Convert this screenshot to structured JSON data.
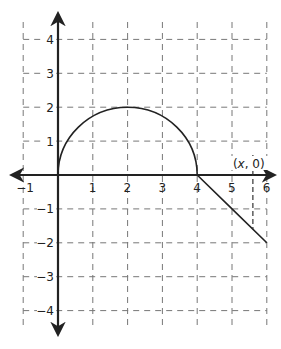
{
  "chart_data": {
    "type": "line",
    "title": "",
    "xlabel": "",
    "ylabel": "",
    "xlim": [
      -1,
      6
    ],
    "ylim": [
      -4,
      4
    ],
    "grid": true,
    "grid_style": "dashed",
    "x_ticks": [
      -1,
      1,
      2,
      3,
      4,
      5,
      6
    ],
    "x_tick_labels": [
      "−1",
      "1",
      "2",
      "3",
      "4",
      "5",
      "6"
    ],
    "y_ticks": [
      4,
      3,
      2,
      1,
      -1,
      -2,
      -3,
      -4
    ],
    "y_tick_labels": [
      "4",
      "3",
      "2",
      "1",
      "−1",
      "−2",
      "−3",
      "−4"
    ],
    "series": [
      {
        "name": "semicircle",
        "shape": "upper semicircle",
        "center": [
          2,
          0
        ],
        "radius": 2,
        "x": [
          0,
          0.5,
          1,
          1.5,
          2,
          2.5,
          3,
          3.5,
          4
        ],
        "y": [
          0,
          1.32,
          1.73,
          1.94,
          2,
          1.94,
          1.73,
          1.32,
          0
        ]
      },
      {
        "name": "line segment",
        "x": [
          4,
          5,
          6
        ],
        "y": [
          0,
          -1,
          -2
        ]
      }
    ],
    "annotations": [
      {
        "text": "(x, 0)",
        "x": 5.6,
        "y": 0,
        "note": "vertical dashed line from (x,0) down to the line segment"
      }
    ],
    "marker_x": 5.6
  },
  "labels": {
    "point_label_open": "(",
    "point_label_var": "x",
    "point_label_rest": ", 0)"
  },
  "colors": {
    "axis": "#222222",
    "grid": "#777777",
    "curve": "#222222"
  }
}
